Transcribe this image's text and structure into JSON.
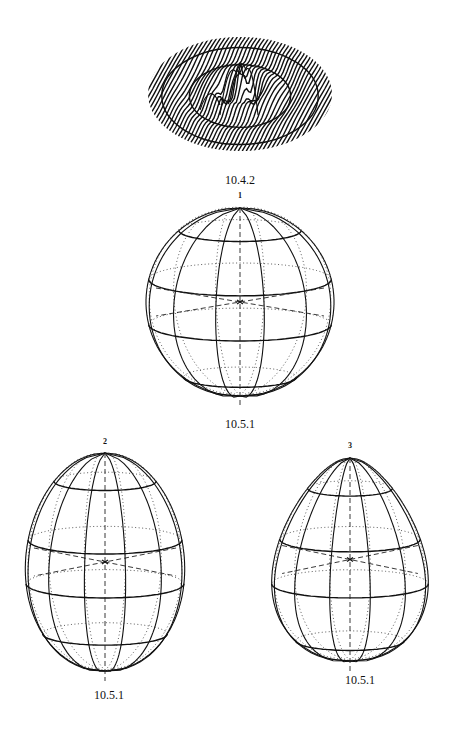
{
  "page": {
    "page_number": ""
  },
  "figures": [
    {
      "id": "surface",
      "caption": "10.4.2",
      "label": ""
    },
    {
      "id": "sphere-1",
      "caption": "10.5.1",
      "label": "1"
    },
    {
      "id": "sphere-2",
      "caption": "10.5.1",
      "label": "2"
    },
    {
      "id": "sphere-3",
      "caption": "10.5.1",
      "label": "3"
    }
  ]
}
